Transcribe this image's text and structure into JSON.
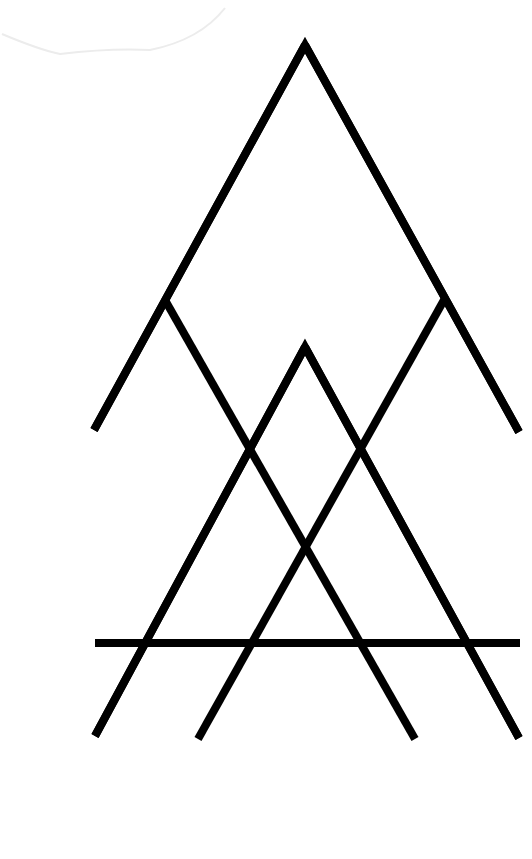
{
  "canvas": {
    "width": 532,
    "height": 859,
    "background": "#ffffff",
    "stroke_color": "#000000",
    "stroke_width": 8
  },
  "artwork": {
    "description": "Geometric line-art of nested overlapping triangles with a horizontal bar",
    "segments": [
      {
        "name": "outer-triangle-left-leg",
        "x1": 305,
        "y1": 45,
        "x2": 94,
        "y2": 430
      },
      {
        "name": "outer-triangle-right-leg",
        "x1": 305,
        "y1": 45,
        "x2": 519,
        "y2": 432
      },
      {
        "name": "left-inner-diagonal",
        "x1": 165,
        "y1": 300,
        "x2": 415,
        "y2": 739
      },
      {
        "name": "right-inner-diagonal",
        "x1": 444,
        "y1": 300,
        "x2": 198,
        "y2": 739
      },
      {
        "name": "inner-triangle-left-leg",
        "x1": 305,
        "y1": 347,
        "x2": 95,
        "y2": 736
      },
      {
        "name": "inner-triangle-right-leg",
        "x1": 305,
        "y1": 347,
        "x2": 519,
        "y2": 738
      },
      {
        "name": "horizontal-bar",
        "x1": 95,
        "y1": 643,
        "x2": 520,
        "y2": 643
      }
    ],
    "faint_mark": {
      "path": "M2 34 Q40 50 60 54 Q110 48 150 50 Q200 40 225 8",
      "color": "#ececec"
    }
  }
}
